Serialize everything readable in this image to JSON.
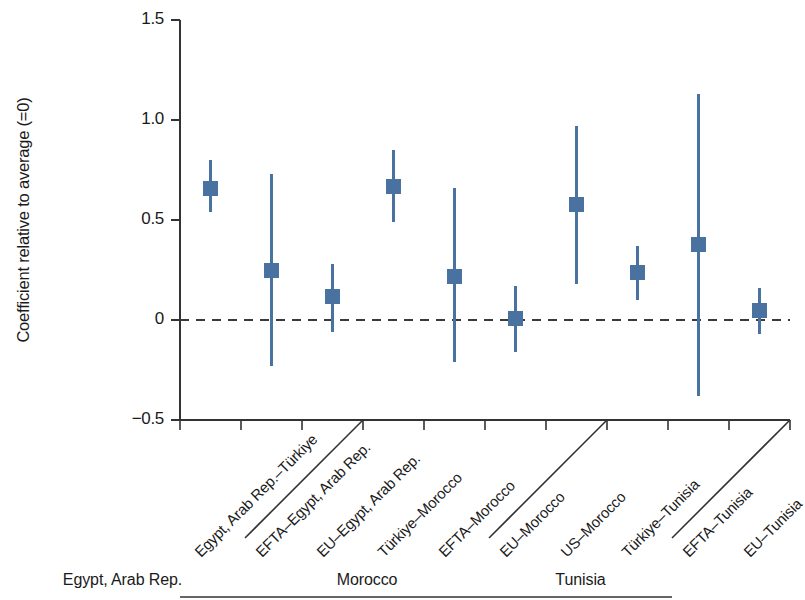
{
  "chart_data": {
    "type": "scatter",
    "title": "",
    "xlabel": "",
    "ylabel": "Coefficient relative to average (=0)",
    "ylim": [
      -0.5,
      1.5
    ],
    "yticks": [
      "1.5",
      "1.0",
      "0.5",
      "0",
      "−0.5"
    ],
    "ytick_values": [
      1.5,
      1.0,
      0.5,
      0,
      -0.5
    ],
    "grid": false,
    "legend": "none",
    "reference_line": {
      "value": 0,
      "style": "dashed",
      "color": "#3a3a3a"
    },
    "marker_color": "#4a72a0",
    "categories": [
      "Egypt, Arab Rep.–Türkiye",
      "EFTA–Egypt, Arab Rep.",
      "EU–Egypt, Arab Rep.",
      "Türkiye–Morocco",
      "EFTA–Morocco",
      "EU–Morocco",
      "US–Morocco",
      "Türkiye–Tunisia",
      "EFTA–Tunisia",
      "EU–Tunisia"
    ],
    "values": [
      0.66,
      0.25,
      0.12,
      0.67,
      0.22,
      0.01,
      0.58,
      0.24,
      0.38,
      0.05
    ],
    "ci_low": [
      0.54,
      -0.23,
      -0.06,
      0.49,
      -0.21,
      -0.16,
      0.18,
      0.1,
      -0.38,
      -0.07
    ],
    "ci_high": [
      0.8,
      0.73,
      0.28,
      0.85,
      0.66,
      0.17,
      0.97,
      0.37,
      1.13,
      0.16
    ],
    "groups": [
      {
        "label": "Egypt, Arab Rep.",
        "start_index": 0,
        "end_index": 2
      },
      {
        "label": "Morocco",
        "start_index": 3,
        "end_index": 6
      },
      {
        "label": "Tunisia",
        "start_index": 7,
        "end_index": 9
      }
    ]
  }
}
